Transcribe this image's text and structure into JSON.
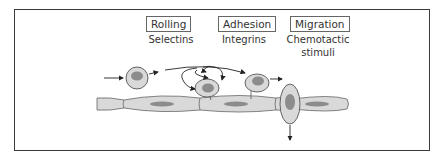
{
  "diagram": {
    "stages": [
      {
        "label": "Rolling",
        "mediator": "Selectins"
      },
      {
        "label": "Adhesion",
        "mediator": "Integrins"
      },
      {
        "label": "Migration",
        "mediator": "Chemotactic stimuli",
        "mediator_lines": [
          "Chemotactic",
          "stimuli"
        ]
      }
    ],
    "colors": {
      "cell_fill": "#d9d9d9",
      "nucleus_fill": "#8c8c8c",
      "outline": "#555555",
      "frame": "#3a3a3a"
    }
  }
}
